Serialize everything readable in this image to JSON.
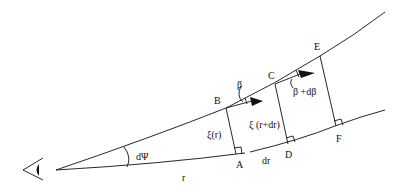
{
  "diagram": {
    "type": "geometric-optics-ray-diagram",
    "colors": {
      "line": "#111111",
      "background": "#ffffff"
    },
    "observer": {
      "icon": "eye-icon"
    },
    "points": {
      "A": "A",
      "B": "B",
      "C": "C",
      "D": "D",
      "E": "E",
      "F": "F"
    },
    "labels": {
      "angle_dpsi": "dΨ",
      "radius_r": "r",
      "increment_dr": "dr",
      "xi_r": "ξ(r)",
      "xi_r_dr": "ξ (r+dr)",
      "beta": "β",
      "beta_dbeta": "β +dβ"
    }
  }
}
